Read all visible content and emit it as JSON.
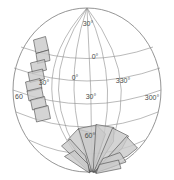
{
  "figure": {
    "name": "orthographic-globe-coverage-map",
    "background_color": "#ffffff",
    "sphere": {
      "center_x": 87,
      "center_y": 90,
      "radius_x": 74,
      "radius_y": 82,
      "outline_color": "#7a7a7a"
    },
    "graticule": {
      "line_color": "#8c8c8c",
      "label_color": "#4a4a4a",
      "meridian_spacing_deg": 30,
      "parallel_spacing_deg": 30
    },
    "footprint_style": {
      "fill": "#c9c9c9",
      "stroke": "#3a3a3a"
    }
  },
  "labels": {
    "latitude": [
      {
        "text": "30°",
        "x": 88,
        "y": 26
      },
      {
        "text": "0°",
        "x": 95,
        "y": 59
      },
      {
        "text": "30°",
        "x": 91,
        "y": 99
      },
      {
        "text": "60°",
        "x": 90,
        "y": 138
      },
      {
        "text": "60",
        "x": 19,
        "y": 99
      }
    ],
    "longitude": [
      {
        "text": "0°",
        "x": 75,
        "y": 80
      },
      {
        "text": "330°",
        "x": 123,
        "y": 83
      },
      {
        "text": "300°",
        "x": 152,
        "y": 100
      },
      {
        "text": "30°",
        "x": 44,
        "y": 85
      }
    ]
  },
  "chart_data": {
    "type": "scatter",
    "title": "",
    "xlabel": "",
    "ylabel": "",
    "projection": "orthographic",
    "grid": true,
    "legend": null,
    "annotations": [
      "30°",
      "0°",
      "30°",
      "60°",
      "60",
      "0°",
      "330°",
      "300°",
      "30°"
    ],
    "meridians_deg": [
      0,
      330,
      300,
      30,
      60,
      270
    ],
    "parallels_deg": [
      60,
      30,
      0,
      -30,
      -60
    ],
    "series": [
      {
        "name": "northwest-footprint-chain",
        "count": 8,
        "polygons": [
          [
            [
              33.5,
              40.0
            ],
            [
              45.5,
              36.5
            ],
            [
              48.5,
              50.0
            ],
            [
              36.0,
              53.5
            ]
          ],
          [
            [
              36.0,
              53.5
            ],
            [
              48.5,
              50.0
            ],
            [
              50.0,
              60.5
            ],
            [
              37.5,
              63.5
            ]
          ],
          [
            [
              30.5,
              63.0
            ],
            [
              44.5,
              59.5
            ],
            [
              46.5,
              70.0
            ],
            [
              32.5,
              73.5
            ]
          ],
          [
            [
              28.0,
              72.5
            ],
            [
              42.5,
              69.0
            ],
            [
              44.5,
              79.0
            ],
            [
              30.0,
              82.5
            ]
          ],
          [
            [
              25.5,
              82.0
            ],
            [
              40.0,
              78.5
            ],
            [
              42.0,
              88.5
            ],
            [
              27.5,
              92.0
            ]
          ],
          [
            [
              27.0,
              91.0
            ],
            [
              41.5,
              87.5
            ],
            [
              43.5,
              97.5
            ],
            [
              29.0,
              101.0
            ]
          ],
          [
            [
              30.5,
              100.0
            ],
            [
              44.5,
              96.5
            ],
            [
              46.5,
              106.5
            ],
            [
              32.5,
              110.0
            ]
          ],
          [
            [
              34.0,
              109.0
            ],
            [
              48.0,
              105.5
            ],
            [
              50.5,
              118.5
            ],
            [
              36.5,
              122.0
            ]
          ]
        ]
      },
      {
        "name": "south-polar-fan",
        "count": 9,
        "polygons": [
          [
            [
              68.0,
              139.5
            ],
            [
              78.0,
              129.0
            ],
            [
              97.0,
              134.5
            ],
            [
              90.5,
              172.0
            ]
          ],
          [
            [
              78.5,
              128.5
            ],
            [
              96.5,
              125.0
            ],
            [
              105.5,
              134.0
            ],
            [
              92.0,
              172.0
            ]
          ],
          [
            [
              96.0,
              124.5
            ],
            [
              114.0,
              127.5
            ],
            [
              113.5,
              141.5
            ],
            [
              93.0,
              172.5
            ]
          ],
          [
            [
              112.5,
              128.0
            ],
            [
              128.5,
              136.0
            ],
            [
              122.0,
              148.5
            ],
            [
              93.5,
              172.5
            ]
          ],
          [
            [
              126.5,
              136.5
            ],
            [
              137.5,
              148.0
            ],
            [
              127.5,
              156.0
            ],
            [
              94.0,
              172.5
            ]
          ],
          [
            [
              61.5,
              146.0
            ],
            [
              70.0,
              139.0
            ],
            [
              85.5,
              156.0
            ],
            [
              90.0,
              172.5
            ]
          ],
          [
            [
              64.5,
              156.5
            ],
            [
              74.5,
              150.5
            ],
            [
              88.0,
              164.0
            ],
            [
              89.5,
              173.0
            ]
          ],
          [
            [
              103.0,
              158.5
            ],
            [
              120.0,
              152.5
            ],
            [
              126.0,
              162.0
            ],
            [
              95.0,
              173.0
            ]
          ],
          [
            [
              99.5,
              164.5
            ],
            [
              118.5,
              160.0
            ],
            [
              121.0,
              168.5
            ],
            [
              96.0,
              173.5
            ]
          ]
        ]
      }
    ]
  }
}
